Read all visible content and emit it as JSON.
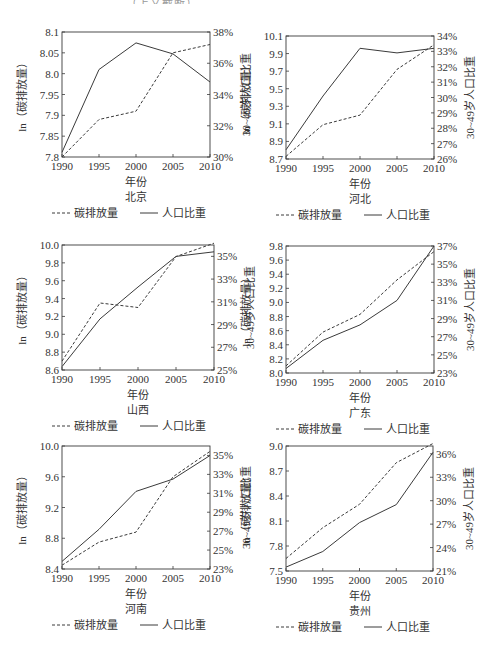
{
  "top_fragment": "…………………………（上文截断）",
  "legend": {
    "dashed": "碳排放量",
    "solid": "人口比重"
  },
  "axis": {
    "xlabel": "年份",
    "ylabel_left": "ln（碳排放量）",
    "ylabel_right": "30~49岁人口比重"
  },
  "chart_data": [
    {
      "type": "line",
      "title": "北京",
      "x": [
        1990,
        1995,
        2000,
        2005,
        2010
      ],
      "xlabel": "年份",
      "ylabel": "ln（碳排放量）",
      "ylabel_right": "30~49岁人口比重",
      "ylim": [
        7.8,
        8.1
      ],
      "yticks": [
        "8.1",
        "8.05",
        "8.0",
        "7.95",
        "7.9",
        "7.85",
        "7.8"
      ],
      "ylim_right": [
        30,
        38
      ],
      "yticks_right": [
        "38%",
        "36%",
        "34%",
        "32%",
        "30%"
      ],
      "series": [
        {
          "name": "碳排放量",
          "style": "dashed",
          "axis": "left",
          "values": [
            7.8,
            7.89,
            7.91,
            8.05,
            8.07
          ]
        },
        {
          "name": "人口比重",
          "style": "solid",
          "axis": "right",
          "values": [
            30.3,
            35.6,
            37.3,
            36.6,
            34.8
          ]
        }
      ],
      "legend_position": "bottom",
      "grid": false
    },
    {
      "type": "line",
      "title": "河北",
      "x": [
        1990,
        1995,
        2000,
        2005,
        2010
      ],
      "xlabel": "年份",
      "ylabel": "ln（碳排放量）",
      "ylabel_right": "30~49岁人口比重",
      "ylim": [
        8.7,
        10.1
      ],
      "yticks": [
        "10.1",
        "9.9",
        "9.7",
        "9.5",
        "9.3",
        "9.1",
        "8.9",
        "8.7"
      ],
      "ylim_right": [
        26,
        34
      ],
      "yticks_right": [
        "34%",
        "33%",
        "32%",
        "31%",
        "30%",
        "29%",
        "28%",
        "27%",
        "26%"
      ],
      "series": [
        {
          "name": "碳排放量",
          "style": "dashed",
          "axis": "left",
          "values": [
            8.73,
            9.09,
            9.2,
            9.72,
            10.0
          ]
        },
        {
          "name": "人口比重",
          "style": "solid",
          "axis": "right",
          "values": [
            26.6,
            30.1,
            33.2,
            32.9,
            33.2
          ]
        }
      ],
      "legend_position": "bottom",
      "grid": false
    },
    {
      "type": "line",
      "title": "山西",
      "x": [
        1990,
        1995,
        2000,
        2005,
        2010
      ],
      "xlabel": "年份",
      "ylabel": "ln（碳排放量）",
      "ylabel_right": "30~49岁人口比重",
      "ylim": [
        8.6,
        10.0
      ],
      "yticks": [
        "10.0",
        "9.8",
        "9.6",
        "9.4",
        "9.2",
        "9.0",
        "8.8",
        "8.6"
      ],
      "ylim_right": [
        25,
        36
      ],
      "yticks_right": [
        "35%",
        "33%",
        "31%",
        "29%",
        "27%",
        "25%"
      ],
      "series": [
        {
          "name": "碳排放量",
          "style": "dashed",
          "axis": "left",
          "values": [
            8.7,
            9.35,
            9.3,
            9.87,
            10.02
          ]
        },
        {
          "name": "人口比重",
          "style": "solid",
          "axis": "right",
          "values": [
            25.3,
            29.5,
            32.3,
            35.0,
            35.4
          ]
        }
      ],
      "legend_position": "bottom",
      "grid": false
    },
    {
      "type": "line",
      "title": "广东",
      "x": [
        1990,
        1995,
        2000,
        2005,
        2010
      ],
      "xlabel": "年份",
      "ylabel": "ln（碳排放量）",
      "ylabel_right": "30~49岁人口比重",
      "ylim": [
        8.0,
        9.8
      ],
      "yticks": [
        "9.8",
        "9.6",
        "9.4",
        "9.2",
        "9.0",
        "8.8",
        "8.6",
        "8.4",
        "8.2",
        "8.0"
      ],
      "ylim_right": [
        23,
        37
      ],
      "yticks_right": [
        "37%",
        "35%",
        "33%",
        "31%",
        "29%",
        "27%",
        "25%",
        "23%"
      ],
      "series": [
        {
          "name": "碳排放量",
          "style": "dashed",
          "axis": "left",
          "values": [
            8.1,
            8.58,
            8.83,
            9.32,
            9.72
          ]
        },
        {
          "name": "人口比重",
          "style": "solid",
          "axis": "right",
          "values": [
            23.5,
            26.6,
            28.3,
            31.0,
            37.0
          ]
        }
      ],
      "legend_position": "bottom",
      "grid": false
    },
    {
      "type": "line",
      "title": "河南",
      "x": [
        1990,
        1995,
        2000,
        2005,
        2010
      ],
      "xlabel": "年份",
      "ylabel": "ln（碳排放量）",
      "ylabel_right": "30~49岁人口比重",
      "ylim": [
        8.4,
        10.0
      ],
      "yticks": [
        "10.0",
        "9.6",
        "9.2",
        "8.8",
        "8.4"
      ],
      "ylim_right": [
        23,
        36
      ],
      "yticks_right": [
        "35%",
        "33%",
        "31%",
        "29%",
        "27%",
        "25%",
        "23%"
      ],
      "series": [
        {
          "name": "碳排放量",
          "style": "dashed",
          "axis": "left",
          "values": [
            8.45,
            8.75,
            8.88,
            9.6,
            9.93
          ]
        },
        {
          "name": "人口比重",
          "style": "solid",
          "axis": "right",
          "values": [
            23.8,
            27.2,
            31.2,
            32.5,
            35.0
          ]
        }
      ],
      "legend_position": "bottom",
      "grid": false
    },
    {
      "type": "line",
      "title": "贵州",
      "x": [
        1990,
        1995,
        2000,
        2005,
        2010
      ],
      "xlabel": "年份",
      "ylabel": "ln（碳排放量）",
      "ylabel_right": "30~49岁人口比重",
      "ylim": [
        7.5,
        9.0
      ],
      "yticks": [
        "9.0",
        "8.7",
        "8.4",
        "8.1",
        "7.8",
        "7.5"
      ],
      "ylim_right": [
        21,
        37
      ],
      "yticks_right": [
        "36%",
        "33%",
        "30%",
        "27%",
        "24%",
        "21%"
      ],
      "series": [
        {
          "name": "碳排放量",
          "style": "dashed",
          "axis": "left",
          "values": [
            7.65,
            8.02,
            8.3,
            8.8,
            9.03
          ]
        },
        {
          "name": "人口比重",
          "style": "solid",
          "axis": "right",
          "values": [
            21.5,
            23.5,
            27.2,
            29.5,
            36.2
          ]
        }
      ],
      "legend_position": "bottom",
      "grid": false
    }
  ],
  "layout": {
    "panels": [
      {
        "left": 62,
        "top": 32,
        "right": 210,
        "bottom": 157,
        "ox": 0,
        "oy": 0
      },
      {
        "left": 286,
        "top": 36,
        "right": 434,
        "bottom": 159,
        "ox": 0,
        "oy": 0
      },
      {
        "left": 62,
        "top": 245,
        "right": 214,
        "bottom": 370,
        "ox": 0,
        "oy": 0
      },
      {
        "left": 286,
        "top": 246,
        "right": 434,
        "bottom": 373,
        "ox": 0,
        "oy": 0
      },
      {
        "left": 62,
        "top": 446,
        "right": 210,
        "bottom": 569,
        "ox": 0,
        "oy": 0
      },
      {
        "left": 286,
        "top": 446,
        "right": 433,
        "bottom": 571,
        "ox": 0,
        "oy": 0
      }
    ],
    "line_color": "#3a3a3a"
  }
}
